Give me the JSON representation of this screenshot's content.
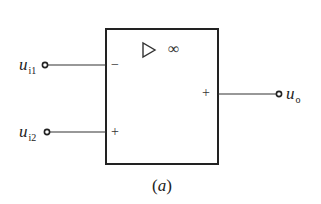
{
  "diagram": {
    "type": "op-amp block",
    "symbol": {
      "triangle": "▷",
      "gain": "∞"
    },
    "inputs": [
      {
        "label": "u",
        "subscript": "i1",
        "sign": "−"
      },
      {
        "label": "u",
        "subscript": "i2",
        "sign": "+"
      }
    ],
    "output": {
      "label": "u",
      "subscript": "o",
      "sign": "+"
    },
    "caption": {
      "open": "(",
      "letter": "a",
      "close": ")"
    },
    "colors": {
      "line": "#222222",
      "background": "#ffffff"
    }
  }
}
